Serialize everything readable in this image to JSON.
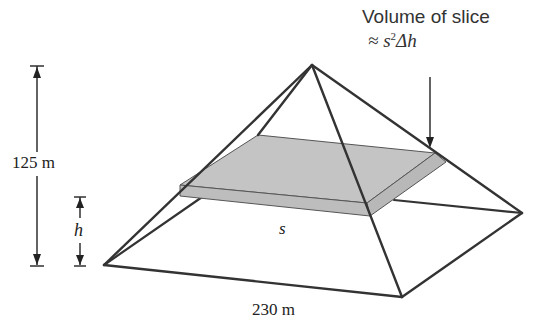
{
  "figure": {
    "annotation": {
      "title": "Volume of slice",
      "formula_prefix": "≈ s",
      "formula_exponent": "2",
      "formula_suffix": "Δh"
    },
    "labels": {
      "pyramid_height": "125 m",
      "slice_height": "h",
      "slice_side": "s",
      "base_width": "230 m"
    },
    "colors": {
      "edge": "#333333",
      "slice_fill": "#c4c4c4",
      "slice_side_fill": "#b8b8b8"
    },
    "geometry": {
      "apex": [
        312,
        65
      ],
      "base_left": [
        104,
        265
      ],
      "base_front": [
        402,
        297
      ],
      "base_right": [
        522,
        213
      ],
      "base_back": [
        221,
        183
      ]
    }
  }
}
